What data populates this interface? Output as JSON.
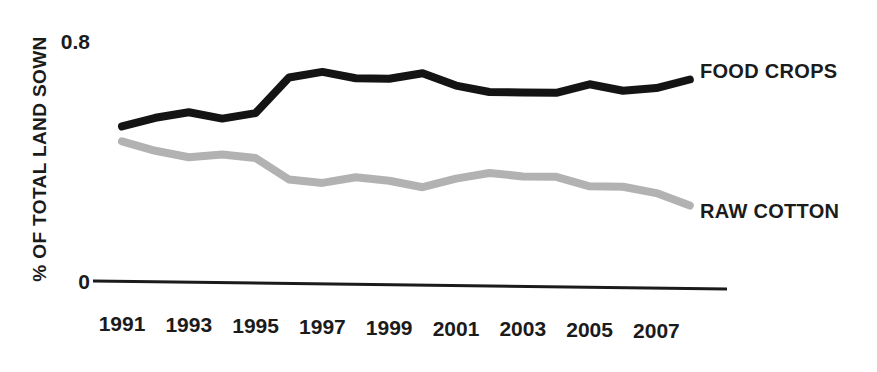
{
  "chart_data": {
    "type": "line",
    "title": "",
    "xlabel": "",
    "ylabel": "% OF TOTAL LAND SOWN",
    "ylim": [
      0,
      0.8
    ],
    "yticks": [
      "0",
      "0.8"
    ],
    "ytick_values": [
      0,
      0.8
    ],
    "grid": false,
    "legend_position": "right-inline",
    "x": [
      1991,
      1992,
      1993,
      1994,
      1995,
      1996,
      1997,
      1998,
      1999,
      2000,
      2001,
      2002,
      2003,
      2004,
      2005,
      2006,
      2007,
      2008
    ],
    "xtick_labels": [
      "1991",
      "1993",
      "1995",
      "1997",
      "1999",
      "2001",
      "2003",
      "2005",
      "2007"
    ],
    "xtick_values": [
      1991,
      1993,
      1995,
      1997,
      1999,
      2001,
      2003,
      2005,
      2007
    ],
    "series": [
      {
        "name": "FOOD CROPS",
        "color": "#141414",
        "values": [
          0.53,
          0.56,
          0.58,
          0.56,
          0.58,
          0.7,
          0.72,
          0.7,
          0.7,
          0.72,
          0.68,
          0.66,
          0.66,
          0.66,
          0.69,
          0.67,
          0.68,
          0.71
        ]
      },
      {
        "name": "RAW COTTON",
        "color": "#b2b2b2",
        "values": [
          0.48,
          0.45,
          0.43,
          0.44,
          0.43,
          0.36,
          0.35,
          0.37,
          0.36,
          0.34,
          0.37,
          0.39,
          0.38,
          0.38,
          0.35,
          0.35,
          0.33,
          0.29
        ]
      }
    ]
  },
  "axis": {
    "y_title": "% OF TOTAL LAND SOWN",
    "y_top_label": "0.8",
    "y_bottom_label": "0"
  },
  "legend": {
    "food_crops": "FOOD CROPS",
    "raw_cotton": "RAW COTTON"
  }
}
